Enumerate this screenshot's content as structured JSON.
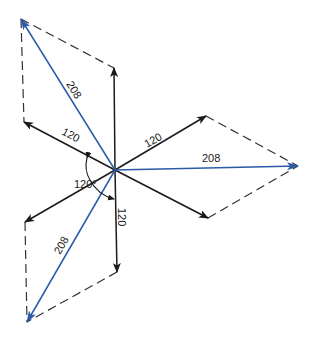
{
  "diagram": {
    "colors": {
      "phase": "#1a1a1a",
      "line": "#2a5aa8",
      "dashed": "#333333"
    },
    "center": [
      115,
      170
    ],
    "phase_vectors": [
      {
        "id": "phase-up",
        "tip": [
          114,
          68
        ],
        "label": ""
      },
      {
        "id": "phase-upper-left",
        "tip": [
          24,
          122
        ],
        "label": "120"
      },
      {
        "id": "phase-upper-right",
        "tip": [
          206,
          116
        ],
        "label": "120"
      },
      {
        "id": "phase-lower-right",
        "tip": [
          208,
          218
        ],
        "label": ""
      },
      {
        "id": "phase-down",
        "tip": [
          117,
          272
        ],
        "label": "120"
      },
      {
        "id": "phase-lower-left",
        "tip": [
          25,
          222
        ],
        "label": ""
      }
    ],
    "line_vectors": [
      {
        "id": "line-upper-left",
        "tip": [
          21,
          19
        ],
        "label": "208"
      },
      {
        "id": "line-right",
        "tip": [
          298,
          166
        ],
        "label": "208"
      },
      {
        "id": "line-lower-left",
        "tip": [
          27,
          322
        ],
        "label": "208"
      }
    ],
    "labels": {
      "phase_upper_left": "120",
      "phase_upper_right": "120",
      "phase_down": "120",
      "line_upper_left": "208",
      "line_right": "208",
      "line_lower_left": "208",
      "angle": "120°"
    }
  }
}
